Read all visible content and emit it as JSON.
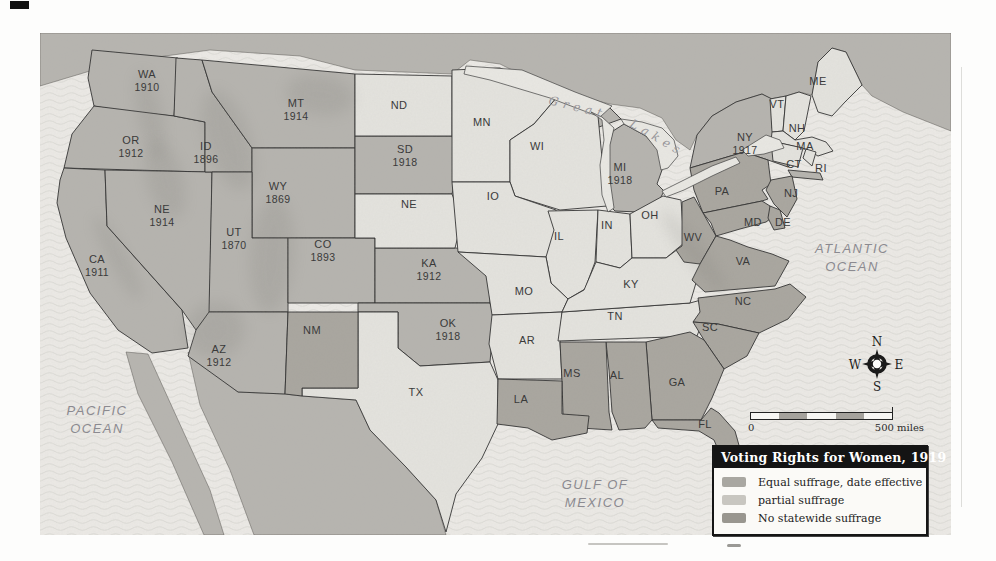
{
  "page_title": "Voting Rights for Women, 1919",
  "legend": {
    "title": "Voting Rights for Women, 1919",
    "items": [
      {
        "key": "equal",
        "label": "Equal suffrage, date effective",
        "color": "#a9a7a1"
      },
      {
        "key": "partial",
        "label": "partial suffrage",
        "color": "#c8c6c0"
      },
      {
        "key": "none",
        "label": "No statewide suffrage",
        "color": "#99968f"
      }
    ]
  },
  "category_fills": {
    "equal": "#b5b3ae",
    "partial": "#e4e3de",
    "none": "#a8a59e"
  },
  "map_colors": {
    "ocean": "#eceae6",
    "wave_line": "#d7d6d1",
    "foreign_land": "#b6b4af",
    "state_border": "#2f2f2f",
    "lake_fill": "#e9e8e3"
  },
  "map": {
    "states": [
      {
        "id": "WA",
        "abbr": "WA",
        "date": "1910",
        "category": "equal",
        "x": 147,
        "y": 74
      },
      {
        "id": "OR",
        "abbr": "OR",
        "date": "1912",
        "category": "equal",
        "x": 131,
        "y": 140
      },
      {
        "id": "CA",
        "abbr": "CA",
        "date": "1911",
        "category": "equal",
        "x": 97,
        "y": 259
      },
      {
        "id": "NV",
        "abbr": "NE",
        "date": "1914",
        "category": "equal",
        "x": 162,
        "y": 209
      },
      {
        "id": "ID",
        "abbr": "ID",
        "date": "1896",
        "category": "equal",
        "x": 206,
        "y": 146
      },
      {
        "id": "MT",
        "abbr": "MT",
        "date": "1914",
        "category": "equal",
        "x": 296,
        "y": 103
      },
      {
        "id": "WY",
        "abbr": "WY",
        "date": "1869",
        "category": "equal",
        "x": 278,
        "y": 186
      },
      {
        "id": "UT",
        "abbr": "UT",
        "date": "1870",
        "category": "equal",
        "x": 234,
        "y": 232
      },
      {
        "id": "CO",
        "abbr": "CO",
        "date": "1893",
        "category": "equal",
        "x": 323,
        "y": 244
      },
      {
        "id": "AZ",
        "abbr": "AZ",
        "date": "1912",
        "category": "equal",
        "x": 219,
        "y": 349
      },
      {
        "id": "KA",
        "abbr": "KA",
        "date": "1912",
        "category": "equal",
        "x": 429,
        "y": 263
      },
      {
        "id": "OK",
        "abbr": "OK",
        "date": "1918",
        "category": "equal",
        "x": 448,
        "y": 323
      },
      {
        "id": "SD",
        "abbr": "SD",
        "date": "1918",
        "category": "equal",
        "x": 405,
        "y": 149
      },
      {
        "id": "MI",
        "abbr": "MI",
        "date": "1918",
        "category": "equal",
        "x": 620,
        "y": 167
      },
      {
        "id": "NY",
        "abbr": "NY",
        "date": "1917",
        "category": "equal",
        "x": 745,
        "y": 137
      },
      {
        "id": "ND",
        "abbr": "ND",
        "date": "",
        "category": "partial",
        "x": 399,
        "y": 105
      },
      {
        "id": "MN",
        "abbr": "MN",
        "date": "",
        "category": "partial",
        "x": 482,
        "y": 122
      },
      {
        "id": "WI",
        "abbr": "WI",
        "date": "",
        "category": "partial",
        "x": 537,
        "y": 146
      },
      {
        "id": "NEB",
        "abbr": "NE",
        "date": "",
        "category": "partial",
        "x": 409,
        "y": 204
      },
      {
        "id": "IO",
        "abbr": "IO",
        "date": "",
        "category": "partial",
        "x": 493,
        "y": 196
      },
      {
        "id": "IL",
        "abbr": "IL",
        "date": "",
        "category": "partial",
        "x": 559,
        "y": 236
      },
      {
        "id": "IN",
        "abbr": "IN",
        "date": "",
        "category": "partial",
        "x": 607,
        "y": 225
      },
      {
        "id": "OH",
        "abbr": "OH",
        "date": "",
        "category": "partial",
        "x": 650,
        "y": 215
      },
      {
        "id": "MO",
        "abbr": "MO",
        "date": "",
        "category": "partial",
        "x": 524,
        "y": 291
      },
      {
        "id": "AR",
        "abbr": "AR",
        "date": "",
        "category": "partial",
        "x": 527,
        "y": 340
      },
      {
        "id": "TX",
        "abbr": "TX",
        "date": "",
        "category": "partial",
        "x": 416,
        "y": 392
      },
      {
        "id": "TN",
        "abbr": "TN",
        "date": "",
        "category": "partial",
        "x": 615,
        "y": 316
      },
      {
        "id": "KY",
        "abbr": "KY",
        "date": "",
        "category": "partial",
        "x": 631,
        "y": 284
      },
      {
        "id": "ME",
        "abbr": "ME",
        "date": "",
        "category": "partial",
        "x": 818,
        "y": 81
      },
      {
        "id": "VT",
        "abbr": "VT",
        "date": "",
        "category": "partial",
        "x": 777,
        "y": 104
      },
      {
        "id": "NH",
        "abbr": "NH",
        "date": "",
        "category": "partial",
        "x": 797,
        "y": 128
      },
      {
        "id": "MA",
        "abbr": "MA",
        "date": "",
        "category": "partial",
        "x": 805,
        "y": 146
      },
      {
        "id": "CT",
        "abbr": "CT",
        "date": "",
        "category": "partial",
        "x": 794,
        "y": 164
      },
      {
        "id": "RI",
        "abbr": "RI",
        "date": "",
        "category": "partial",
        "x": 821,
        "y": 168
      },
      {
        "id": "NM",
        "abbr": "NM",
        "date": "",
        "category": "none",
        "x": 312,
        "y": 330
      },
      {
        "id": "PA",
        "abbr": "PA",
        "date": "",
        "category": "none",
        "x": 722,
        "y": 191
      },
      {
        "id": "NJ",
        "abbr": "NJ",
        "date": "",
        "category": "none",
        "x": 791,
        "y": 193
      },
      {
        "id": "MD",
        "abbr": "MD",
        "date": "",
        "category": "none",
        "x": 753,
        "y": 222
      },
      {
        "id": "DE",
        "abbr": "DE",
        "date": "",
        "category": "none",
        "x": 783,
        "y": 222
      },
      {
        "id": "WV",
        "abbr": "WV",
        "date": "",
        "category": "none",
        "x": 693,
        "y": 237
      },
      {
        "id": "VA",
        "abbr": "VA",
        "date": "",
        "category": "none",
        "x": 743,
        "y": 261
      },
      {
        "id": "NC",
        "abbr": "NC",
        "date": "",
        "category": "none",
        "x": 743,
        "y": 301
      },
      {
        "id": "SC",
        "abbr": "SC",
        "date": "",
        "category": "none",
        "x": 710,
        "y": 327
      },
      {
        "id": "GA",
        "abbr": "GA",
        "date": "",
        "category": "none",
        "x": 677,
        "y": 382
      },
      {
        "id": "AL",
        "abbr": "AL",
        "date": "",
        "category": "none",
        "x": 617,
        "y": 375
      },
      {
        "id": "MS",
        "abbr": "MS",
        "date": "",
        "category": "none",
        "x": 572,
        "y": 373
      },
      {
        "id": "LA",
        "abbr": "LA",
        "date": "",
        "category": "none",
        "x": 521,
        "y": 399
      },
      {
        "id": "FL",
        "abbr": "FL",
        "date": "",
        "category": "none",
        "x": 705,
        "y": 424
      }
    ],
    "water_labels": [
      {
        "id": "pacific-ocean",
        "lines": [
          "PACIFIC",
          "OCEAN"
        ],
        "x": 97,
        "y": 415
      },
      {
        "id": "atlantic-ocean",
        "lines": [
          "ATLANTIC",
          "OCEAN"
        ],
        "x": 852,
        "y": 253
      },
      {
        "id": "gulf-of-mexico",
        "lines": [
          "GULF OF",
          "MEXICO"
        ],
        "x": 595,
        "y": 489
      }
    ],
    "lakes_label": {
      "word1": "Great",
      "word2": "Lakes"
    }
  },
  "scale_bar": {
    "start_label": "0",
    "end_label": "500 miles"
  },
  "compass": {
    "n": "N",
    "e": "E",
    "s": "S",
    "w": "W"
  }
}
